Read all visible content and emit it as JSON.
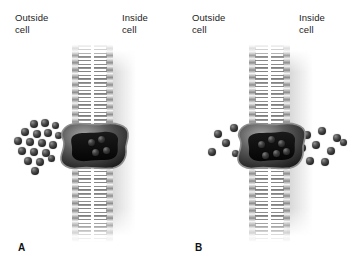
{
  "figure": {
    "background_color": "#ffffff",
    "width": 353,
    "height": 274
  },
  "colors": {
    "particle_dark": "#232323",
    "particle_highlight": "#8f8f8f",
    "protein_dark": "#2b2b2b",
    "protein_rim": "#9a9a9a",
    "membrane_head": "#bdbdbd",
    "membrane_tail": "#7d7d7d",
    "text": "#1c1c1c"
  },
  "panels": [
    {
      "letter": "A",
      "name": "panel-a",
      "labels": {
        "outside": "Outside\ncell",
        "inside": "Inside\ncell"
      },
      "membrane": {
        "name": "phospholipid-bilayer",
        "leaflets": [
          "outer",
          "inner"
        ]
      },
      "protein": {
        "name": "channel-protein",
        "particles_in_channel": 4
      },
      "particles_outside": 18,
      "particles_inside": 0,
      "state": "solute concentrated outside the cell"
    },
    {
      "letter": "B",
      "name": "panel-b",
      "labels": {
        "outside": "Outside\ncell",
        "inside": "Inside\ncell"
      },
      "membrane": {
        "name": "phospholipid-bilayer",
        "leaflets": [
          "outer",
          "inner"
        ]
      },
      "protein": {
        "name": "channel-protein",
        "particles_in_channel": 6
      },
      "particles_outside": 5,
      "particles_inside": 9,
      "state": "solute distributed on both sides of the membrane"
    }
  ],
  "particle_positions": {
    "panel_a_outside": [
      [
        30,
        120
      ],
      [
        41,
        119
      ],
      [
        52,
        122
      ],
      [
        21,
        128
      ],
      [
        33,
        130
      ],
      [
        44,
        129
      ],
      [
        55,
        132
      ],
      [
        14,
        137
      ],
      [
        26,
        138
      ],
      [
        38,
        139
      ],
      [
        49,
        141
      ],
      [
        18,
        147
      ],
      [
        30,
        148
      ],
      [
        42,
        149
      ],
      [
        24,
        157
      ],
      [
        36,
        158
      ],
      [
        48,
        155
      ],
      [
        31,
        167
      ]
    ],
    "panel_a_channel": [
      [
        88,
        139
      ],
      [
        98,
        136
      ],
      [
        92,
        149
      ],
      [
        103,
        147
      ]
    ],
    "panel_b_outside": [
      [
        214,
        130
      ],
      [
        230,
        124
      ],
      [
        222,
        139
      ],
      [
        208,
        148
      ],
      [
        232,
        150
      ]
    ],
    "panel_b_channel": [
      [
        264,
        141
      ],
      [
        274,
        136
      ],
      [
        284,
        140
      ],
      [
        268,
        152
      ],
      [
        279,
        150
      ],
      [
        289,
        148
      ]
    ],
    "panel_b_inside": [
      [
        303,
        131
      ],
      [
        318,
        127
      ],
      [
        333,
        134
      ],
      [
        298,
        144
      ],
      [
        312,
        141
      ],
      [
        327,
        147
      ],
      [
        340,
        139
      ],
      [
        306,
        157
      ],
      [
        321,
        158
      ]
    ]
  }
}
